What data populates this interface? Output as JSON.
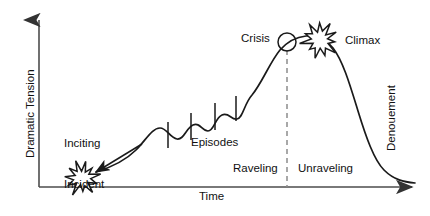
{
  "figure": {
    "type": "narrative-arc-diagram",
    "background_color": "#ffffff",
    "line_color": "#1a1a1a",
    "axis_color": "#4d4d4d",
    "dash_color": "#8c8c8c",
    "width": 430,
    "height": 216
  },
  "axes": {
    "y_label": "Dramatic Tension",
    "x_label": "Time",
    "y_axis": {
      "x": 39,
      "top": 14,
      "bottom": 187,
      "arrow": "up"
    },
    "x_axis": {
      "y": 187,
      "left": 39,
      "right": 420,
      "arrow": "right"
    }
  },
  "labels": {
    "inciting_incident_line1": "Inciting",
    "inciting_incident_line2": "Incident",
    "episodes": "Episodes",
    "crisis": "Crisis",
    "climax": "Climax",
    "denouement": "Denouement",
    "raveling": "Raveling",
    "unraveling": "Unraveling"
  },
  "markers": {
    "starburst_inciting": {
      "cx": 82,
      "cy": 178,
      "r_outer": 17,
      "r_inner": 8,
      "points": 11
    },
    "starburst_climax": {
      "cx": 320,
      "cy": 40,
      "r_outer": 18,
      "r_inner": 9,
      "points": 11
    },
    "crisis_circle": {
      "cx": 287,
      "cy": 42,
      "r": 9
    },
    "divider_dashed": {
      "x": 287,
      "y_top": 50,
      "y_bottom": 187
    },
    "pointer_arrow": {
      "from_x": 142,
      "from_y": 144,
      "to_x": 96,
      "to_y": 172
    },
    "episode_ticks": [
      {
        "x": 168,
        "y_top": 122,
        "y_bottom": 148
      },
      {
        "x": 191,
        "y_top": 113,
        "y_bottom": 140
      },
      {
        "x": 215,
        "y_top": 103,
        "y_bottom": 130
      },
      {
        "x": 236,
        "y_top": 96,
        "y_bottom": 121
      }
    ]
  },
  "chart_data": {
    "type": "line",
    "title": "",
    "xlabel": "Time",
    "ylabel": "Dramatic Tension",
    "grid": false,
    "legend": "none",
    "xlim": [
      0,
      430
    ],
    "ylim": [
      0,
      216
    ],
    "annotations": [
      {
        "text": "Inciting Incident",
        "x": 82,
        "y": 178
      },
      {
        "text": "Episodes",
        "x": 205,
        "y": 120
      },
      {
        "text": "Crisis",
        "x": 287,
        "y": 42
      },
      {
        "text": "Climax",
        "x": 320,
        "y": 40
      },
      {
        "text": "Denouement",
        "x": 392,
        "y": 120
      },
      {
        "text": "Raveling",
        "x": 255,
        "y": 170
      },
      {
        "text": "Unraveling",
        "x": 325,
        "y": 170
      }
    ],
    "curve_path": "M 96,172 C 112,167 126,160 136,150 C 146,140 152,128 160,128 C 167,128 170,138 177,139 C 184,140 186,128 193,125 C 200,122 202,131 208,131 C 214,131 215,118 222,115 C 229,112 231,120 237,119 C 243,118 244,104 252,95 C 262,83 270,62 280,50 C 288,41 296,37 306,36 C 316,35 326,39 333,48 C 343,61 350,85 358,111 C 366,137 374,160 384,170 C 394,180 404,182 415,183"
  }
}
